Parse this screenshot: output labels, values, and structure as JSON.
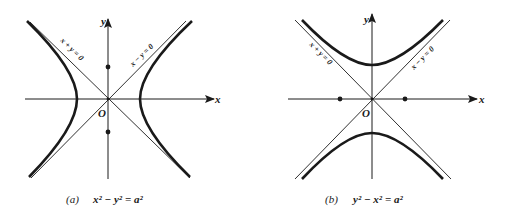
{
  "figure": {
    "panel_a": {
      "axis_x_label": "x",
      "axis_y_label": "y",
      "origin_label": "O",
      "asymptote_left_label": "x + y = 0",
      "asymptote_right_label": "x − y = 0",
      "caption_tag": "(a)",
      "caption_equation": "x² − y² = a²",
      "foci": "on y-axis (dots at ±)",
      "branches": "left and right"
    },
    "panel_b": {
      "axis_x_label": "x",
      "axis_y_label": "y",
      "origin_label": "O",
      "asymptote_left_label": "x + y = 0",
      "asymptote_right_label": "x − y = 0",
      "caption_tag": "(b)",
      "caption_equation": "y² − x² = a²",
      "foci": "on x-axis (dots at ±)",
      "branches": "upper and lower"
    }
  },
  "colors": {
    "ink": "#1a1a1a",
    "background": "#ffffff"
  }
}
